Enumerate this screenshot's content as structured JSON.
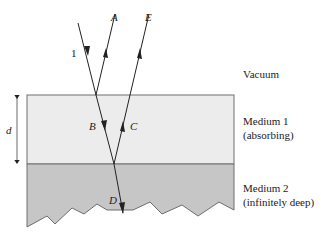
{
  "diagram": {
    "type": "optics ray diagram",
    "colors": {
      "background": "#ffffff",
      "medium1": "#ececec",
      "medium2": "#c6c6c6",
      "outline": "#6e6e6e",
      "ray": "#222222"
    },
    "regions": {
      "vacuum": "Vacuum",
      "medium1_line1": "Medium 1",
      "medium1_line2": "(absorbing)",
      "medium2_line1": "Medium 2",
      "medium2_line2": "(infinitely deep)"
    },
    "rays": {
      "incident": "1",
      "reflected_top": "A",
      "transmitted_medium1": "B",
      "reflected_internal": "C",
      "transmitted_medium2": "D",
      "emergent": "E"
    },
    "dimension": {
      "thickness": "d"
    }
  }
}
